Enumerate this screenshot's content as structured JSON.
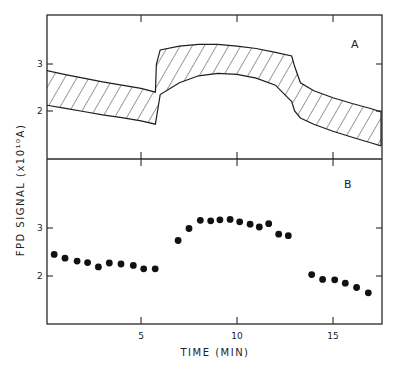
{
  "chart_data": [
    {
      "panel": "A",
      "type": "area",
      "title": "",
      "panel_label": "A",
      "xlabel": "TIME (MIN)",
      "ylabel": "FPD SIGNAL (x10¹⁰A)",
      "xlim": [
        0,
        17.5
      ],
      "ylim": [
        1.0,
        3.9
      ],
      "xticks": [
        5,
        10,
        15
      ],
      "yticks": [
        2,
        3
      ],
      "grid": false,
      "legend": null,
      "description": "Hatched band showing range (upper/lower bounds) of predicted FPD signal",
      "series": [
        {
          "name": "upper bound",
          "x": [
            0,
            1,
            2,
            3,
            4,
            5,
            5.75,
            5.8,
            6.0,
            7.0,
            8.0,
            9.0,
            10.0,
            11.0,
            12.0,
            12.85,
            13.0,
            13.3,
            14.0,
            15.0,
            16.0,
            17.0,
            17.5
          ],
          "values": [
            2.87,
            2.78,
            2.7,
            2.62,
            2.55,
            2.48,
            2.4,
            3.0,
            3.3,
            3.38,
            3.42,
            3.42,
            3.38,
            3.33,
            3.25,
            3.17,
            2.95,
            2.6,
            2.43,
            2.28,
            2.16,
            2.05,
            1.98
          ]
        },
        {
          "name": "lower bound",
          "x": [
            0,
            1,
            2,
            3,
            4,
            5,
            5.75,
            6.0,
            7.0,
            8.0,
            9.0,
            10.0,
            11.0,
            12.0,
            12.85,
            13.0,
            13.3,
            14.0,
            15.0,
            16.0,
            17.0,
            17.5
          ],
          "values": [
            2.13,
            2.06,
            1.99,
            1.92,
            1.86,
            1.79,
            1.72,
            2.35,
            2.6,
            2.75,
            2.8,
            2.78,
            2.7,
            2.55,
            2.2,
            2.0,
            1.85,
            1.72,
            1.57,
            1.44,
            1.32,
            1.26
          ]
        }
      ]
    },
    {
      "panel": "B",
      "type": "scatter",
      "title": "",
      "panel_label": "B",
      "xlabel": "TIME (MIN)",
      "ylabel": "FPD SIGNAL (x10¹⁰A)",
      "xlim": [
        0,
        17.5
      ],
      "ylim": [
        1.0,
        3.9
      ],
      "xticks": [
        5,
        10,
        15
      ],
      "yticks": [
        2,
        3
      ],
      "grid": false,
      "legend": null,
      "series": [
        {
          "name": "measured FPD signal",
          "x": [
            0.48,
            1.04,
            1.67,
            2.22,
            2.78,
            3.35,
            3.96,
            4.6,
            5.14,
            5.74,
            6.93,
            7.5,
            8.09,
            8.63,
            9.11,
            9.64,
            10.14,
            10.68,
            11.16,
            11.65,
            12.17,
            12.67,
            13.89,
            14.46,
            15.09,
            15.64,
            16.23,
            16.84
          ],
          "values": [
            2.45,
            2.37,
            2.31,
            2.28,
            2.19,
            2.27,
            2.25,
            2.22,
            2.15,
            2.15,
            2.74,
            2.99,
            3.16,
            3.15,
            3.17,
            3.18,
            3.13,
            3.08,
            3.02,
            3.09,
            2.87,
            2.84,
            2.03,
            1.93,
            1.92,
            1.85,
            1.76,
            1.65
          ]
        }
      ]
    }
  ],
  "labels": {
    "ylabel": "FPD SIGNAL (x10¹⁰A)",
    "xlabel": "TIME (MIN)",
    "panel_a": "A",
    "panel_b": "B",
    "xtick_5": "5",
    "xtick_10": "10",
    "xtick_15": "15",
    "a_ytick_2": "2",
    "a_ytick_3": "3",
    "b_ytick_2": "2",
    "b_ytick_3": "3"
  }
}
